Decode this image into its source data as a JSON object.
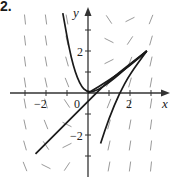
{
  "problem_label": "2.",
  "chart_data": {
    "type": "line",
    "title": "",
    "subtitle": "Direction field with solution curves",
    "xlabel": "x",
    "ylabel": "y",
    "xlim": [
      -3.6,
      3.9
    ],
    "ylim": [
      -3.9,
      4.0
    ],
    "x_ticks": [
      -3,
      -2,
      -1,
      0,
      1,
      2,
      3
    ],
    "x_tick_labels": [
      "-2",
      "0",
      "2"
    ],
    "y_ticks": [
      -3,
      -2,
      -1,
      1,
      2,
      3
    ],
    "y_tick_labels": [
      "2",
      "-2"
    ],
    "grid": false,
    "legend": null,
    "slope_field": {
      "description": "short line segments on a lattice showing slopes of the ODE; steep negative slopes at upper-left, near-horizontal near x≈1-3 upper region, positive steep at lower right",
      "grid_x": [
        -3,
        -2,
        -1,
        0,
        1,
        2,
        3
      ],
      "grid_y": [
        -3,
        -2,
        -1,
        0,
        1,
        2,
        3
      ]
    },
    "series": [
      {
        "name": "curve-1 (parabola-like)",
        "points": [
          [
            -1.2,
            3.8
          ],
          [
            -0.8,
            1.6
          ],
          [
            -0.4,
            0.4
          ],
          [
            0,
            0
          ],
          [
            0.5,
            0.15
          ],
          [
            1,
            0.5
          ],
          [
            1.5,
            0.9
          ],
          [
            2,
            1.35
          ],
          [
            2.8,
            2
          ]
        ]
      },
      {
        "name": "curve-2",
        "points": [
          [
            0,
            0
          ],
          [
            1,
            0.6
          ],
          [
            2,
            1.3
          ],
          [
            2.8,
            2
          ]
        ]
      },
      {
        "name": "curve-3 (line)",
        "points": [
          [
            -2.5,
            -2.9
          ],
          [
            0,
            -0.4
          ],
          [
            1,
            0.6
          ],
          [
            2.8,
            2
          ]
        ]
      },
      {
        "name": "curve-4 (line)",
        "points": [
          [
            0.6,
            -2.4
          ],
          [
            1,
            -1.2
          ],
          [
            1.5,
            0
          ],
          [
            2,
            0.9
          ],
          [
            2.8,
            2
          ]
        ]
      }
    ]
  }
}
